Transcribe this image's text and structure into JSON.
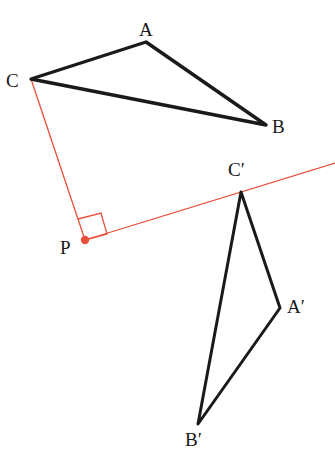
{
  "figure": {
    "background_color": "#ffffff",
    "stroke_color": "#1a1a1a",
    "mirror_color": "#e8503c",
    "width": 335,
    "height": 456
  },
  "labels": {
    "A": "A",
    "B": "B",
    "C": "C",
    "P": "P",
    "A_prime": "A′",
    "B_prime": "B′",
    "C_prime": "C′"
  },
  "points": {
    "A": {
      "x": 146,
      "y": 42
    },
    "B": {
      "x": 266,
      "y": 125
    },
    "C": {
      "x": 31,
      "y": 79
    },
    "P": {
      "x": 85,
      "y": 240
    },
    "A_prime": {
      "x": 280,
      "y": 308
    },
    "B_prime": {
      "x": 198,
      "y": 424
    },
    "C_prime": {
      "x": 241,
      "y": 192
    }
  },
  "label_positions": {
    "A": {
      "x": 139,
      "y": 20
    },
    "B": {
      "x": 272,
      "y": 117
    },
    "C": {
      "x": 6,
      "y": 71
    },
    "P": {
      "x": 60,
      "y": 238
    },
    "A_prime": {
      "x": 287,
      "y": 297
    },
    "B_prime": {
      "x": 185,
      "y": 430
    },
    "C_prime": {
      "x": 228,
      "y": 160
    }
  },
  "triangle_abc": {
    "name": "triangle-abc",
    "vertices": "C,A,B",
    "stroke_width": 3.4
  },
  "triangle_abc_prime": {
    "name": "triangle-a-prime-b-prime-c-prime",
    "vertices": "C′,A′,B′",
    "stroke_width": 3.0
  },
  "mirror_line": {
    "name": "mirror-line",
    "from": {
      "x": 85,
      "y": 240
    },
    "to": {
      "x": 335,
      "y": 163
    },
    "stroke_width": 1.3
  },
  "perpendicular_segment": {
    "name": "segment-c-to-p",
    "from": {
      "x": 31,
      "y": 79
    },
    "to": {
      "x": 85,
      "y": 240
    },
    "stroke_width": 1.3
  },
  "right_angle_marker": {
    "name": "right-angle-marker-at-p",
    "path": "78,219 101,213 107,234 85,240",
    "stroke_width": 1.3
  },
  "point_marker_p": {
    "name": "point-marker-p",
    "radius": 4.2,
    "fill": "#e8503c"
  }
}
